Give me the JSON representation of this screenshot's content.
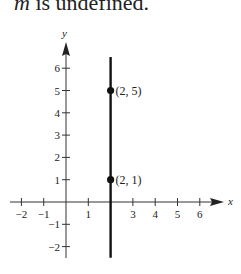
{
  "caption": {
    "var": "m",
    "text": " is undefined."
  },
  "chart_data": {
    "type": "line",
    "title": "",
    "xlabel": "x",
    "ylabel": "y",
    "xlim": [
      -2,
      6
    ],
    "ylim": [
      -2,
      6
    ],
    "x_ticks": [
      "−2",
      "−1",
      "1",
      "3",
      "4",
      "5",
      "6"
    ],
    "y_ticks": [
      "6",
      "5",
      "4",
      "3",
      "2",
      "1",
      "−1",
      "−2"
    ],
    "series": [
      {
        "name": "vertical line x = 2",
        "x": [
          2,
          2
        ],
        "y": [
          -2.5,
          6.5
        ]
      }
    ],
    "points": [
      {
        "x": 2,
        "y": 5,
        "label": "(2, 5)"
      },
      {
        "x": 2,
        "y": 1,
        "label": "(2, 1)"
      }
    ],
    "grid": false
  }
}
